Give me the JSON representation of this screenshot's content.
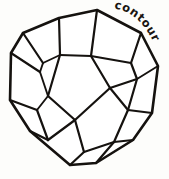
{
  "figure": {
    "title": "contour",
    "style": "hand-drawn ink sketch",
    "background_color": "#fdfdfb",
    "ink_color": "#15120f",
    "canvas": {
      "width": 169,
      "height": 179
    }
  },
  "annotation": {
    "label_text": "contour",
    "label_placement": "upper-right, curving along the outer silhouette",
    "label_color": "#191511"
  },
  "drawing": {
    "silhouette_name": "outer-contour",
    "silhouette_points": "97,10 59,18 23,33 11,53 10,100 30,131 70,165 96,163 133,140 152,113 158,66 141,33",
    "interior_edges": [
      "97,10 91,56",
      "59,18 60,55",
      "91,56 60,55",
      "23,33 43,63",
      "43,63 60,55",
      "11,53 40,72",
      "40,72 43,63",
      "141,33 131,63",
      "131,63 91,56",
      "158,66 137,79",
      "137,79 131,63",
      "91,56 110,88",
      "110,88 137,79",
      "60,55 48,96",
      "48,96 40,72",
      "48,96 75,120",
      "75,120 110,88",
      "10,100 37,110",
      "37,110 48,96",
      "37,110 48,140",
      "48,140 30,131",
      "48,140 75,120",
      "75,120 84,152",
      "84,152 70,165",
      "84,152 114,142",
      "114,142 96,163",
      "114,142 133,140",
      "114,142 128,110",
      "128,110 110,88",
      "128,110 152,113",
      "128,110 137,79"
    ]
  }
}
